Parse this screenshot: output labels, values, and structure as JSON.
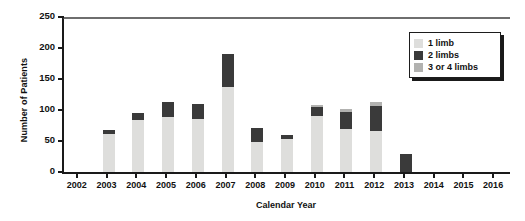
{
  "chart_data": {
    "type": "bar",
    "stacked": true,
    "title": "",
    "xlabel": "Calendar Year",
    "ylabel": "Number of Patients",
    "categories": [
      "2002",
      "2003",
      "2004",
      "2005",
      "2006",
      "2007",
      "2008",
      "2009",
      "2010",
      "2011",
      "2012",
      "2013",
      "2014",
      "2015",
      "2016"
    ],
    "ylim": [
      0,
      250
    ],
    "yticks": [
      0,
      50,
      100,
      150,
      200,
      250
    ],
    "grid": false,
    "legend_position": "top-right",
    "series": [
      {
        "name": "1 limb",
        "color": "#dededc",
        "values": [
          0,
          61,
          84,
          88,
          85,
          137,
          48,
          53,
          90,
          70,
          66,
          0,
          0,
          0,
          0
        ]
      },
      {
        "name": "2 limbs",
        "color": "#3a3a3a",
        "values": [
          0,
          6,
          11,
          25,
          25,
          53,
          23,
          6,
          15,
          27,
          40,
          29,
          0,
          0,
          0
        ]
      },
      {
        "name": "3 or 4 limbs",
        "color": "#b2b2b0",
        "values": [
          0,
          0,
          0,
          0,
          0,
          0,
          0,
          0,
          3,
          5,
          7,
          0,
          0,
          0,
          0
        ]
      }
    ],
    "totals": [
      0,
      67,
      95,
      113,
      110,
      190,
      71,
      59,
      108,
      102,
      113,
      29,
      0,
      0,
      0
    ]
  },
  "axes": {
    "ylabel": "Number of Patients",
    "xlabel": "Calendar Year",
    "ytick_labels": [
      "250",
      "200",
      "150",
      "100",
      "50",
      "0"
    ],
    "xtick_labels": [
      "2002",
      "2003",
      "2004",
      "2005",
      "2006",
      "2007",
      "2008",
      "2009",
      "2010",
      "2011",
      "2012",
      "2013",
      "2014",
      "2015",
      "2016"
    ]
  },
  "legend": {
    "items": [
      {
        "label": "1 limb",
        "color": "#dededc"
      },
      {
        "label": "2 limbs",
        "color": "#3a3a3a"
      },
      {
        "label": "3 or 4 limbs",
        "color": "#b2b2b0"
      }
    ]
  }
}
